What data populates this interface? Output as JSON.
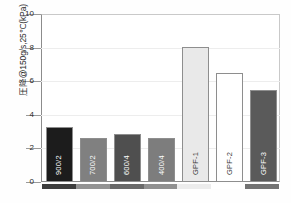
{
  "chart_data": {
    "type": "bar",
    "title": "",
    "subtitle": "",
    "xlabel": "",
    "ylabel": "圧降@150g/s,25℃(kPa)",
    "ylim": [
      0,
      10
    ],
    "yticks": [
      0,
      2,
      4,
      6,
      8,
      10
    ],
    "ytick_labels": [
      "0",
      "2",
      "4",
      "6",
      "8",
      "10"
    ],
    "grid": true,
    "legend": "none",
    "categories": [
      "900/2",
      "700/2",
      "600/4",
      "400/4",
      "GPF-1",
      "GPF-2",
      "GPF-3"
    ],
    "values": [
      3.3,
      2.6,
      2.85,
      2.6,
      8.05,
      6.5,
      5.5
    ],
    "bar_colors": [
      "#1c1c1c",
      "#808080",
      "#4f4f4f",
      "#7d7d7d",
      "#e9e9e9",
      "#ffffff",
      "#5a5a5a"
    ],
    "bar_label_colors": [
      "#ffffff",
      "#ffffff",
      "#ffffff",
      "#ffffff",
      "#3a3a3a",
      "#3a3a3a",
      "#ffffff"
    ],
    "bar_edge_color": "#8e8e8e",
    "axis_color": "#8c8c8c",
    "grid_color": "#ededed",
    "background": "#ffffff"
  },
  "caption": {
    "text": ""
  }
}
